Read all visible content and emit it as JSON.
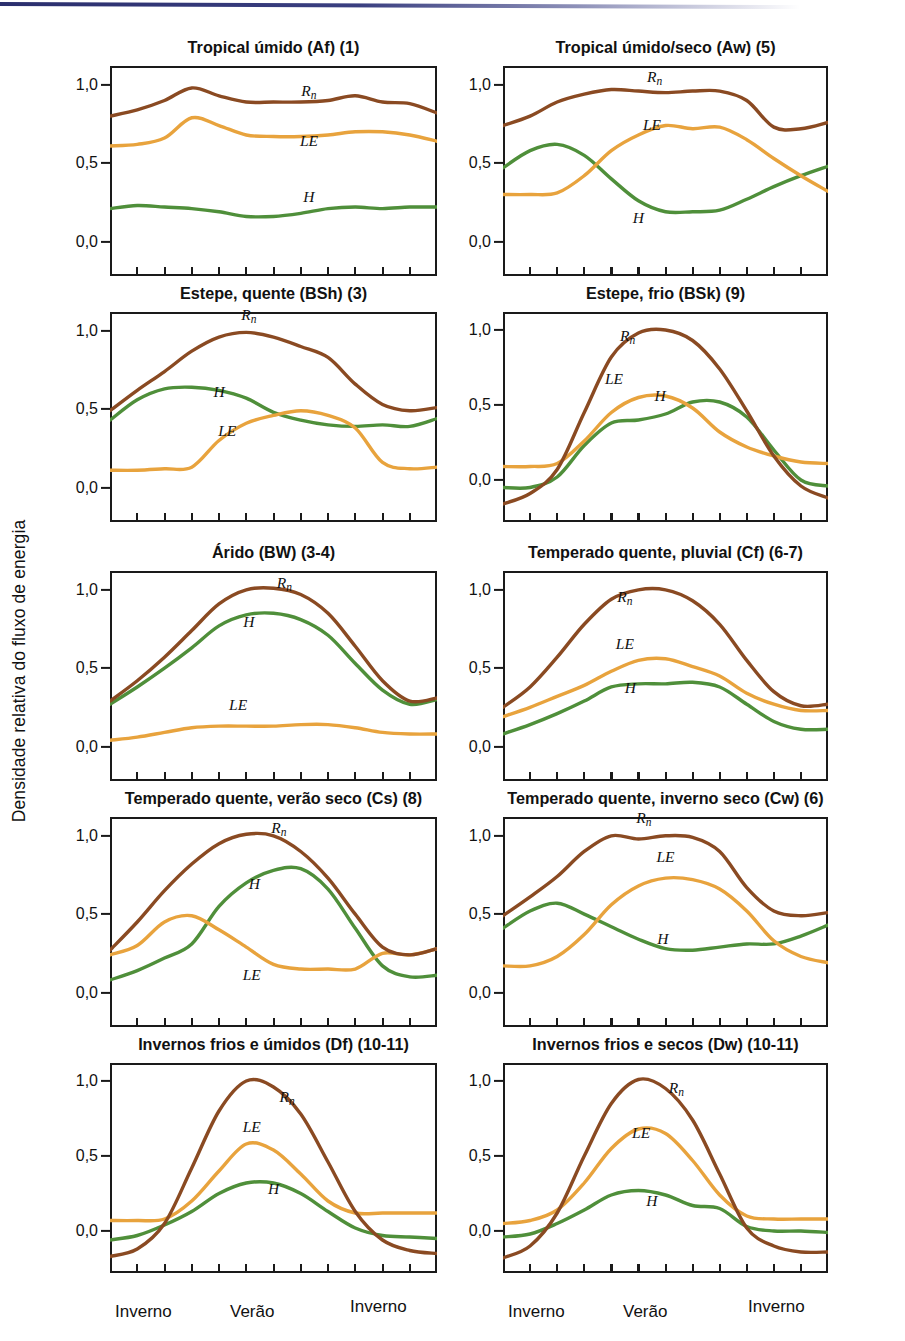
{
  "figure": {
    "y_axis_label": "Densidade relativa do fluxo de energia",
    "x_tick_labels": [
      "Inverno",
      "Verão",
      "Inverno"
    ],
    "y_tick_labels": [
      "1,0",
      "0,5",
      "0,0"
    ],
    "y_tick_values": [
      1.0,
      0.5,
      0.0
    ],
    "colors": {
      "Rn": "#8a4a22",
      "LE": "#e8a33d",
      "H": "#4f8f3a",
      "axis": "#1a1a1a",
      "scan_artifact": "#2b2f6e"
    },
    "series_labels": [
      "Rn",
      "LE",
      "H"
    ],
    "x_interior_ticks": 11
  },
  "chart_data": [
    {
      "type": "line",
      "title": "Tropical úmido (Af) (1)",
      "xlabel": "",
      "ylabel": "Densidade relativa do fluxo de energia",
      "ylim": [
        -0.22,
        1.12
      ],
      "xlim": [
        0,
        12
      ],
      "grid": false,
      "legend": "inline-labels",
      "x": [
        0,
        1,
        2,
        3,
        4,
        5,
        6,
        7,
        8,
        9,
        10,
        11,
        12
      ],
      "series": [
        {
          "name": "Rn",
          "label_x": 7.3,
          "label_y": 0.93,
          "values": [
            0.8,
            0.84,
            0.9,
            0.98,
            0.93,
            0.89,
            0.89,
            0.89,
            0.9,
            0.93,
            0.89,
            0.88,
            0.82
          ]
        },
        {
          "name": "LE",
          "label_x": 7.3,
          "label_y": 0.61,
          "values": [
            0.61,
            0.62,
            0.66,
            0.79,
            0.74,
            0.68,
            0.67,
            0.67,
            0.68,
            0.7,
            0.7,
            0.68,
            0.64
          ]
        },
        {
          "name": "H",
          "label_x": 7.3,
          "label_y": 0.25,
          "values": [
            0.21,
            0.23,
            0.22,
            0.21,
            0.19,
            0.16,
            0.16,
            0.18,
            0.21,
            0.22,
            0.21,
            0.22,
            0.22
          ]
        }
      ]
    },
    {
      "type": "line",
      "title": "Tropical úmido/seco (Aw) (5)",
      "xlabel": "",
      "ylabel": "",
      "ylim": [
        -0.22,
        1.12
      ],
      "xlim": [
        0,
        12
      ],
      "grid": false,
      "legend": "inline-labels",
      "x": [
        0,
        1,
        2,
        3,
        4,
        5,
        6,
        7,
        8,
        9,
        10,
        11,
        12
      ],
      "series": [
        {
          "name": "Rn",
          "label_x": 5.6,
          "label_y": 1.02,
          "values": [
            0.74,
            0.8,
            0.89,
            0.94,
            0.97,
            0.96,
            0.95,
            0.96,
            0.96,
            0.9,
            0.73,
            0.72,
            0.76
          ]
        },
        {
          "name": "LE",
          "label_x": 5.5,
          "label_y": 0.71,
          "values": [
            0.3,
            0.3,
            0.31,
            0.42,
            0.58,
            0.68,
            0.74,
            0.72,
            0.73,
            0.65,
            0.53,
            0.42,
            0.32
          ]
        },
        {
          "name": "H",
          "label_x": 5.0,
          "label_y": 0.12,
          "values": [
            0.47,
            0.58,
            0.62,
            0.55,
            0.4,
            0.26,
            0.19,
            0.19,
            0.2,
            0.27,
            0.35,
            0.42,
            0.48
          ]
        }
      ]
    },
    {
      "type": "line",
      "title": "Estepe, quente (BSh) (3)",
      "xlabel": "",
      "ylabel": "",
      "ylim": [
        -0.22,
        1.12
      ],
      "xlim": [
        0,
        12
      ],
      "grid": false,
      "legend": "inline-labels",
      "x": [
        0,
        1,
        2,
        3,
        4,
        5,
        6,
        7,
        8,
        9,
        10,
        11,
        12
      ],
      "series": [
        {
          "name": "Rn",
          "label_x": 5.1,
          "label_y": 1.07,
          "values": [
            0.49,
            0.62,
            0.74,
            0.87,
            0.96,
            0.99,
            0.96,
            0.9,
            0.83,
            0.66,
            0.53,
            0.49,
            0.51
          ]
        },
        {
          "name": "LE",
          "label_x": 4.3,
          "label_y": 0.33,
          "values": [
            0.11,
            0.11,
            0.12,
            0.13,
            0.3,
            0.41,
            0.46,
            0.49,
            0.46,
            0.38,
            0.16,
            0.12,
            0.13
          ]
        },
        {
          "name": "H",
          "label_x": 4.0,
          "label_y": 0.58,
          "values": [
            0.43,
            0.56,
            0.63,
            0.64,
            0.62,
            0.57,
            0.48,
            0.43,
            0.4,
            0.39,
            0.4,
            0.39,
            0.44
          ]
        }
      ]
    },
    {
      "type": "line",
      "title": "Estepe, frio (BSk) (9)",
      "xlabel": "",
      "ylabel": "",
      "ylim": [
        -0.28,
        1.12
      ],
      "xlim": [
        0,
        12
      ],
      "grid": false,
      "legend": "inline-labels",
      "x": [
        0,
        1,
        2,
        3,
        4,
        5,
        6,
        7,
        8,
        9,
        10,
        11,
        12
      ],
      "series": [
        {
          "name": "Rn",
          "label_x": 4.6,
          "label_y": 0.93,
          "values": [
            -0.16,
            -0.09,
            0.07,
            0.45,
            0.82,
            0.98,
            1.0,
            0.93,
            0.74,
            0.46,
            0.16,
            -0.04,
            -0.12
          ]
        },
        {
          "name": "LE",
          "label_x": 4.1,
          "label_y": 0.64,
          "values": [
            0.09,
            0.09,
            0.11,
            0.26,
            0.45,
            0.55,
            0.56,
            0.48,
            0.32,
            0.22,
            0.16,
            0.12,
            0.11
          ]
        },
        {
          "name": "H",
          "label_x": 5.8,
          "label_y": 0.53,
          "values": [
            -0.05,
            -0.05,
            0.02,
            0.23,
            0.38,
            0.4,
            0.44,
            0.52,
            0.52,
            0.42,
            0.2,
            0.0,
            -0.04
          ]
        }
      ]
    },
    {
      "type": "line",
      "title": "Árido (BW) (3-4)",
      "xlabel": "",
      "ylabel": "",
      "ylim": [
        -0.22,
        1.12
      ],
      "xlim": [
        0,
        12
      ],
      "grid": false,
      "legend": "inline-labels",
      "x": [
        0,
        1,
        2,
        3,
        4,
        5,
        6,
        7,
        8,
        9,
        10,
        11,
        12
      ],
      "series": [
        {
          "name": "Rn",
          "label_x": 6.4,
          "label_y": 1.01,
          "values": [
            0.29,
            0.42,
            0.57,
            0.74,
            0.91,
            1.0,
            1.01,
            0.97,
            0.85,
            0.64,
            0.42,
            0.29,
            0.31
          ]
        },
        {
          "name": "LE",
          "label_x": 4.7,
          "label_y": 0.23,
          "values": [
            0.04,
            0.06,
            0.09,
            0.12,
            0.13,
            0.13,
            0.13,
            0.14,
            0.14,
            0.12,
            0.09,
            0.08,
            0.08
          ]
        },
        {
          "name": "H",
          "label_x": 5.1,
          "label_y": 0.76,
          "values": [
            0.27,
            0.38,
            0.5,
            0.63,
            0.77,
            0.84,
            0.85,
            0.81,
            0.71,
            0.53,
            0.36,
            0.27,
            0.3
          ]
        }
      ]
    },
    {
      "type": "line",
      "title": "Temperado quente, pluvial (Cf) (6-7)",
      "xlabel": "",
      "ylabel": "",
      "ylim": [
        -0.22,
        1.12
      ],
      "xlim": [
        0,
        12
      ],
      "grid": false,
      "legend": "inline-labels",
      "x": [
        0,
        1,
        2,
        3,
        4,
        5,
        6,
        7,
        8,
        9,
        10,
        11,
        12
      ],
      "series": [
        {
          "name": "Rn",
          "label_x": 4.5,
          "label_y": 0.92,
          "values": [
            0.25,
            0.38,
            0.57,
            0.78,
            0.94,
            1.0,
            1.0,
            0.93,
            0.78,
            0.55,
            0.35,
            0.26,
            0.27
          ]
        },
        {
          "name": "LE",
          "label_x": 4.5,
          "label_y": 0.62,
          "values": [
            0.19,
            0.25,
            0.32,
            0.39,
            0.48,
            0.55,
            0.56,
            0.51,
            0.45,
            0.34,
            0.27,
            0.23,
            0.23
          ]
        },
        {
          "name": "H",
          "label_x": 4.7,
          "label_y": 0.34,
          "values": [
            0.08,
            0.14,
            0.21,
            0.29,
            0.38,
            0.4,
            0.4,
            0.41,
            0.38,
            0.27,
            0.16,
            0.11,
            0.11
          ]
        }
      ]
    },
    {
      "type": "line",
      "title": "Temperado quente, verão seco (Cs) (8)",
      "xlabel": "",
      "ylabel": "",
      "ylim": [
        -0.22,
        1.12
      ],
      "xlim": [
        0,
        12
      ],
      "grid": false,
      "legend": "inline-labels",
      "x": [
        0,
        1,
        2,
        3,
        4,
        5,
        6,
        7,
        8,
        9,
        10,
        11,
        12
      ],
      "series": [
        {
          "name": "Rn",
          "label_x": 6.2,
          "label_y": 1.02,
          "values": [
            0.27,
            0.45,
            0.65,
            0.82,
            0.95,
            1.01,
            1.0,
            0.9,
            0.73,
            0.5,
            0.29,
            0.24,
            0.28
          ]
        },
        {
          "name": "LE",
          "label_x": 5.2,
          "label_y": 0.08,
          "values": [
            0.24,
            0.3,
            0.45,
            0.49,
            0.4,
            0.29,
            0.18,
            0.15,
            0.15,
            0.15,
            0.25,
            0.24,
            0.28
          ]
        },
        {
          "name": "H",
          "label_x": 5.3,
          "label_y": 0.66,
          "values": [
            0.08,
            0.14,
            0.22,
            0.31,
            0.55,
            0.7,
            0.78,
            0.79,
            0.66,
            0.41,
            0.17,
            0.1,
            0.11
          ]
        }
      ]
    },
    {
      "type": "line",
      "title": "Temperado quente, inverno seco (Cw) (6)",
      "xlabel": "",
      "ylabel": "",
      "ylim": [
        -0.22,
        1.12
      ],
      "xlim": [
        0,
        12
      ],
      "grid": false,
      "legend": "inline-labels",
      "x": [
        0,
        1,
        2,
        3,
        4,
        5,
        6,
        7,
        8,
        9,
        10,
        11,
        12
      ],
      "series": [
        {
          "name": "Rn",
          "label_x": 5.2,
          "label_y": 1.08,
          "values": [
            0.49,
            0.61,
            0.74,
            0.9,
            1.0,
            0.98,
            1.0,
            0.99,
            0.9,
            0.67,
            0.52,
            0.49,
            0.51
          ]
        },
        {
          "name": "LE",
          "label_x": 6.0,
          "label_y": 0.83,
          "values": [
            0.17,
            0.17,
            0.23,
            0.37,
            0.56,
            0.68,
            0.73,
            0.72,
            0.66,
            0.52,
            0.33,
            0.23,
            0.19
          ]
        },
        {
          "name": "H",
          "label_x": 5.9,
          "label_y": 0.31,
          "values": [
            0.41,
            0.52,
            0.57,
            0.5,
            0.42,
            0.34,
            0.28,
            0.27,
            0.29,
            0.31,
            0.31,
            0.36,
            0.43
          ]
        }
      ]
    },
    {
      "type": "line",
      "title": "Invernos frios e úmidos (Df) (10-11)",
      "xlabel": "",
      "ylabel": "",
      "ylim": [
        -0.28,
        1.12
      ],
      "xlim": [
        0,
        12
      ],
      "grid": false,
      "legend": "inline-labels",
      "x": [
        0,
        1,
        2,
        3,
        4,
        5,
        6,
        7,
        8,
        9,
        10,
        11,
        12
      ],
      "series": [
        {
          "name": "Rn",
          "label_x": 6.5,
          "label_y": 0.86,
          "values": [
            -0.17,
            -0.12,
            0.05,
            0.42,
            0.8,
            1.0,
            0.96,
            0.78,
            0.46,
            0.13,
            -0.06,
            -0.13,
            -0.15
          ]
        },
        {
          "name": "LE",
          "label_x": 5.2,
          "label_y": 0.66,
          "values": [
            0.07,
            0.07,
            0.08,
            0.2,
            0.4,
            0.58,
            0.54,
            0.38,
            0.2,
            0.12,
            0.12,
            0.12,
            0.12
          ]
        },
        {
          "name": "H",
          "label_x": 6.0,
          "label_y": 0.25,
          "values": [
            -0.06,
            -0.03,
            0.04,
            0.13,
            0.25,
            0.32,
            0.32,
            0.25,
            0.13,
            0.02,
            -0.03,
            -0.04,
            -0.05
          ]
        }
      ]
    },
    {
      "type": "line",
      "title": "Invernos frios e secos (Dw) (10-11)",
      "xlabel": "",
      "ylabel": "",
      "ylim": [
        -0.28,
        1.12
      ],
      "xlim": [
        0,
        12
      ],
      "grid": false,
      "legend": "inline-labels",
      "x": [
        0,
        1,
        2,
        3,
        4,
        5,
        6,
        7,
        8,
        9,
        10,
        11,
        12
      ],
      "series": [
        {
          "name": "Rn",
          "label_x": 6.4,
          "label_y": 0.92,
          "values": [
            -0.18,
            -0.1,
            0.12,
            0.5,
            0.85,
            1.01,
            0.95,
            0.74,
            0.38,
            0.02,
            -0.1,
            -0.14,
            -0.14
          ]
        },
        {
          "name": "LE",
          "label_x": 5.1,
          "label_y": 0.62,
          "values": [
            0.05,
            0.07,
            0.14,
            0.32,
            0.55,
            0.68,
            0.65,
            0.47,
            0.24,
            0.1,
            0.08,
            0.08,
            0.08
          ]
        },
        {
          "name": "H",
          "label_x": 5.5,
          "label_y": 0.17,
          "values": [
            -0.04,
            -0.02,
            0.05,
            0.14,
            0.24,
            0.27,
            0.24,
            0.17,
            0.15,
            0.03,
            0.0,
            0.0,
            -0.01
          ]
        }
      ]
    }
  ]
}
